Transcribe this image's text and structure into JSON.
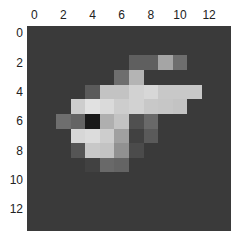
{
  "chart_data": {
    "type": "heatmap",
    "title": "",
    "xlabel": "",
    "ylabel": "",
    "colormap": "gray",
    "x_ticks_position": "top",
    "x_ticks": [
      0,
      2,
      4,
      6,
      8,
      10,
      12
    ],
    "y_ticks": [
      0,
      2,
      4,
      6,
      8,
      10,
      12
    ],
    "xlim": [
      -0.5,
      13.5
    ],
    "ylim": [
      13.5,
      -0.5
    ],
    "grid": false,
    "rows": 14,
    "cols": 14,
    "values": [
      [
        58,
        58,
        58,
        58,
        58,
        58,
        58,
        58,
        58,
        58,
        58,
        58,
        58,
        58
      ],
      [
        58,
        58,
        58,
        58,
        58,
        58,
        58,
        58,
        58,
        58,
        58,
        58,
        58,
        58
      ],
      [
        58,
        58,
        58,
        58,
        58,
        58,
        58,
        95,
        95,
        165,
        110,
        58,
        58,
        58
      ],
      [
        58,
        58,
        58,
        58,
        58,
        58,
        110,
        180,
        58,
        58,
        58,
        58,
        58,
        58
      ],
      [
        58,
        58,
        58,
        58,
        90,
        195,
        195,
        210,
        215,
        200,
        200,
        200,
        58,
        58
      ],
      [
        58,
        58,
        58,
        205,
        225,
        218,
        205,
        210,
        200,
        198,
        195,
        58,
        58,
        58
      ],
      [
        58,
        58,
        110,
        100,
        25,
        175,
        195,
        80,
        105,
        58,
        58,
        58,
        58,
        58
      ],
      [
        58,
        58,
        58,
        215,
        220,
        205,
        160,
        65,
        90,
        58,
        58,
        58,
        58,
        58
      ],
      [
        58,
        58,
        58,
        85,
        200,
        195,
        145,
        75,
        58,
        58,
        58,
        58,
        58,
        58
      ],
      [
        58,
        58,
        58,
        58,
        65,
        105,
        100,
        58,
        58,
        58,
        58,
        58,
        58,
        58
      ],
      [
        58,
        58,
        58,
        58,
        58,
        58,
        58,
        58,
        58,
        58,
        58,
        58,
        58,
        58
      ],
      [
        58,
        58,
        58,
        58,
        58,
        58,
        58,
        58,
        58,
        58,
        58,
        58,
        58,
        58
      ],
      [
        58,
        58,
        58,
        58,
        58,
        58,
        58,
        58,
        58,
        58,
        58,
        58,
        58,
        58
      ],
      [
        58,
        58,
        58,
        58,
        58,
        58,
        58,
        58,
        58,
        58,
        58,
        58,
        58,
        58
      ]
    ]
  },
  "axes": {
    "x_tick_labels": [
      "0",
      "2",
      "4",
      "6",
      "8",
      "10",
      "12"
    ],
    "y_tick_labels": [
      "0",
      "2",
      "4",
      "6",
      "8",
      "10",
      "12"
    ]
  }
}
